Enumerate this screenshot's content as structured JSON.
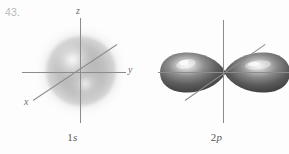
{
  "figure": {
    "problem_number": "43.",
    "panels": [
      {
        "id": "1s-panel",
        "orbital_type": "1s",
        "caption_number": "1",
        "caption_letter": "s",
        "axes": [
          {
            "name": "z",
            "label": "z",
            "orientation": "vertical"
          },
          {
            "name": "y",
            "label": "y",
            "orientation": "horizontal"
          },
          {
            "name": "x",
            "label": "x",
            "orientation": "diagonal"
          }
        ]
      },
      {
        "id": "2p-panel",
        "orbital_type": "2p",
        "caption_number": "2",
        "caption_letter": "p",
        "axes": [
          {
            "name": "z",
            "label": "",
            "orientation": "vertical"
          },
          {
            "name": "y",
            "label": "",
            "orientation": "horizontal"
          },
          {
            "name": "x",
            "label": "",
            "orientation": "diagonal"
          }
        ]
      }
    ]
  },
  "colors": {
    "background": "#fdfdfd",
    "axis_line": "#8c8c8c",
    "problem_number_text": "#b8b8b8",
    "axis_label_text": "#707070",
    "caption_text": "#5a5a5a",
    "s_orbital_cloud": "#9b9b9b",
    "p_lobe_dark": "#4a4a4a",
    "p_lobe_mid": "#7d7d7d",
    "p_lobe_highlight": "#e8e8e8"
  }
}
